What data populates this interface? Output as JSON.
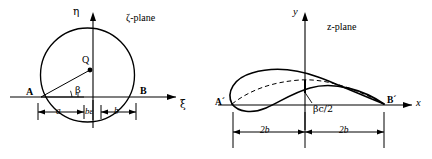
{
  "figure": {
    "type": "joukowski-transformation-diagram",
    "panels": [
      {
        "id": "zeta-plane",
        "title": "ζ-plane",
        "axes": {
          "x_label": "ξ",
          "y_label": "η"
        },
        "labels": {
          "point_a": "A",
          "point_b": "B",
          "center": "Q",
          "angle": "β",
          "dim_left": "a",
          "dim_mid": "bε",
          "dim_right": "b"
        }
      },
      {
        "id": "z-plane",
        "title": "z-plane",
        "axes": {
          "x_label": "x",
          "y_label": "y"
        },
        "labels": {
          "point_a": "Aˊ",
          "point_b": "Bˊ",
          "camber": "βc/2",
          "dim_left": "2b",
          "dim_right": "2b"
        }
      }
    ],
    "colors": {
      "ink": "#000000",
      "background": "#ffffff"
    }
  }
}
